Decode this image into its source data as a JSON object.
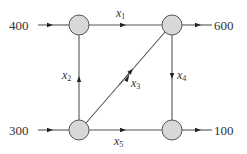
{
  "diagram": {
    "type": "network-flow",
    "nodes": [
      {
        "id": "A",
        "position": "top-left",
        "cx": 79,
        "cy": 25
      },
      {
        "id": "B",
        "position": "top-right",
        "cx": 172,
        "cy": 25
      },
      {
        "id": "C",
        "position": "bottom-left",
        "cx": 79,
        "cy": 130
      },
      {
        "id": "D",
        "position": "bottom-right",
        "cx": 172,
        "cy": 130
      }
    ],
    "external_flows": {
      "in_top_left": "400",
      "out_top_right": "600",
      "in_bottom_left": "300",
      "out_bottom_right": "100"
    },
    "edges": {
      "x1": {
        "var": "x",
        "sub": "1",
        "from": "A",
        "to": "B"
      },
      "x2": {
        "var": "x",
        "sub": "2",
        "from": "C",
        "to": "A"
      },
      "x3": {
        "var": "x",
        "sub": "3",
        "from": "C",
        "to": "B"
      },
      "x4": {
        "var": "x",
        "sub": "4",
        "from": "B",
        "to": "D"
      },
      "x5": {
        "var": "x",
        "sub": "5",
        "from": "C",
        "to": "D"
      }
    },
    "colors": {
      "node_fill": "#d8d8d8",
      "line": "#555555",
      "text": "#333333"
    }
  }
}
